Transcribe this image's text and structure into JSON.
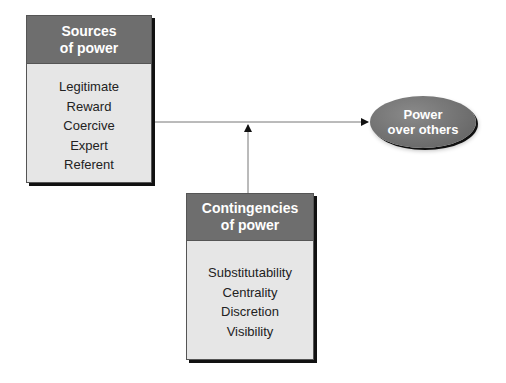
{
  "sources": {
    "title_line1": "Sources",
    "title_line2": "of power",
    "items": [
      "Legitimate",
      "Reward",
      "Coercive",
      "Expert",
      "Referent"
    ]
  },
  "contingencies": {
    "title_line1": "Contingencies",
    "title_line2": "of power",
    "items": [
      "Substitutability",
      "Centrality",
      "Discretion",
      "Visibility"
    ]
  },
  "outcome": {
    "line1": "Power",
    "line2": "over others"
  },
  "colors": {
    "header": "#6e6e6e",
    "body": "#e6e6e6",
    "line": "#777777"
  }
}
